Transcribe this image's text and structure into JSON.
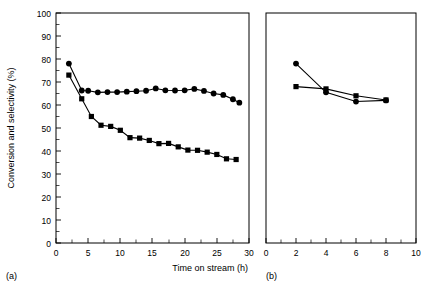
{
  "figure": {
    "ylabel": "Conversion and selectivity (%)",
    "panel_a_label": "(a)",
    "panel_b_label": "(b)",
    "xlabel_a": "Time on stream (h)",
    "colors": {
      "line": "#000000",
      "marker": "#000000",
      "background": "#ffffff"
    }
  },
  "chart_data": [
    {
      "type": "line",
      "panel": "(a)",
      "title": "",
      "xlabel": "Time on stream (h)",
      "ylabel": "Conversion and selectivity (%)",
      "xlim": [
        0,
        30
      ],
      "ylim": [
        0,
        100
      ],
      "xticks": [
        0,
        5,
        10,
        15,
        20,
        25,
        30
      ],
      "xtick_labels": [
        "0",
        "5",
        "10",
        "15",
        "20",
        "25",
        "30"
      ],
      "yticks": [
        0,
        10,
        20,
        30,
        40,
        50,
        60,
        70,
        80,
        90,
        100
      ],
      "ytick_labels": [
        "0",
        "10",
        "20",
        "30",
        "40",
        "50",
        "60",
        "70",
        "80",
        "90",
        "100"
      ],
      "minor_xticks": [
        2.5,
        7.5,
        12.5,
        17.5,
        22.5,
        27.5
      ],
      "minor_yticks": [
        5,
        15,
        25,
        35,
        45,
        55,
        65,
        75,
        85,
        95
      ],
      "grid": false,
      "legend": "none",
      "series": [
        {
          "name": "selectivity",
          "marker": "circle",
          "x": [
            2.0,
            4.0,
            5.0,
            6.5,
            8.0,
            9.5,
            11.0,
            12.5,
            14.0,
            15.5,
            17.0,
            18.5,
            20.0,
            21.5,
            23.0,
            24.5,
            26.0,
            27.5,
            28.5
          ],
          "y": [
            78.0,
            66.3,
            66.2,
            65.5,
            65.6,
            65.6,
            65.8,
            66.0,
            66.2,
            67.2,
            66.4,
            66.3,
            66.4,
            67.0,
            66.1,
            65.0,
            64.4,
            62.5,
            61.0
          ]
        },
        {
          "name": "conversion",
          "marker": "square",
          "x": [
            2.0,
            4.0,
            5.5,
            7.0,
            8.5,
            10.0,
            11.5,
            13.0,
            14.5,
            16.0,
            17.5,
            19.0,
            20.5,
            22.0,
            23.5,
            25.0,
            26.5,
            28.0
          ],
          "y": [
            73.0,
            62.7,
            55.0,
            51.2,
            50.7,
            49.0,
            45.8,
            45.6,
            44.6,
            43.2,
            43.3,
            41.8,
            40.4,
            40.3,
            39.5,
            38.5,
            36.6,
            36.3
          ]
        }
      ]
    },
    {
      "type": "line",
      "panel": "(b)",
      "title": "",
      "xlabel": "",
      "ylabel": "",
      "xlim": [
        0,
        10
      ],
      "ylim": [
        0,
        100
      ],
      "xticks": [
        0,
        2,
        4,
        6,
        8,
        10
      ],
      "xtick_labels": [
        "0",
        "2",
        "4",
        "6",
        "8",
        "10"
      ],
      "yticks": [
        0,
        10,
        20,
        30,
        40,
        50,
        60,
        70,
        80,
        90,
        100
      ],
      "ytick_labels": [],
      "minor_xticks": [
        1,
        3,
        5,
        7,
        9
      ],
      "minor_yticks": [],
      "grid": false,
      "legend": "none",
      "series": [
        {
          "name": "selectivity",
          "marker": "circle",
          "x": [
            2.0,
            4.0,
            6.0,
            8.0
          ],
          "y": [
            78.0,
            65.5,
            61.5,
            62.0
          ]
        },
        {
          "name": "conversion",
          "marker": "square",
          "x": [
            2.0,
            4.0,
            6.0,
            8.0
          ],
          "y": [
            68.0,
            67.0,
            64.0,
            62.2
          ]
        }
      ]
    }
  ]
}
